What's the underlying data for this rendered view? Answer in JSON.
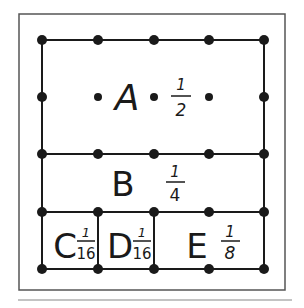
{
  "diagram": {
    "grid": {
      "columns_x": [
        42,
        98,
        154,
        209,
        264
      ],
      "rows_y": [
        40,
        97,
        154,
        212,
        269
      ]
    },
    "regions": [
      {
        "id": "A",
        "letter": "A",
        "fraction_num": "1",
        "fraction_den": "2",
        "fraction": "1/2"
      },
      {
        "id": "B",
        "letter": "B",
        "fraction_num": "1",
        "fraction_den": "4",
        "fraction": "1/4"
      },
      {
        "id": "C",
        "letter": "C",
        "fraction_num": "1",
        "fraction_den": "16",
        "fraction": "1/16"
      },
      {
        "id": "D",
        "letter": "D",
        "fraction_num": "1",
        "fraction_den": "16",
        "fraction": "1/16"
      },
      {
        "id": "E",
        "letter": "E",
        "fraction_num": "1",
        "fraction_den": "8",
        "fraction": "1/8"
      }
    ],
    "colors": {
      "ink": "#1a1a1a",
      "frame": "#555555",
      "background": "#ffffff"
    }
  }
}
